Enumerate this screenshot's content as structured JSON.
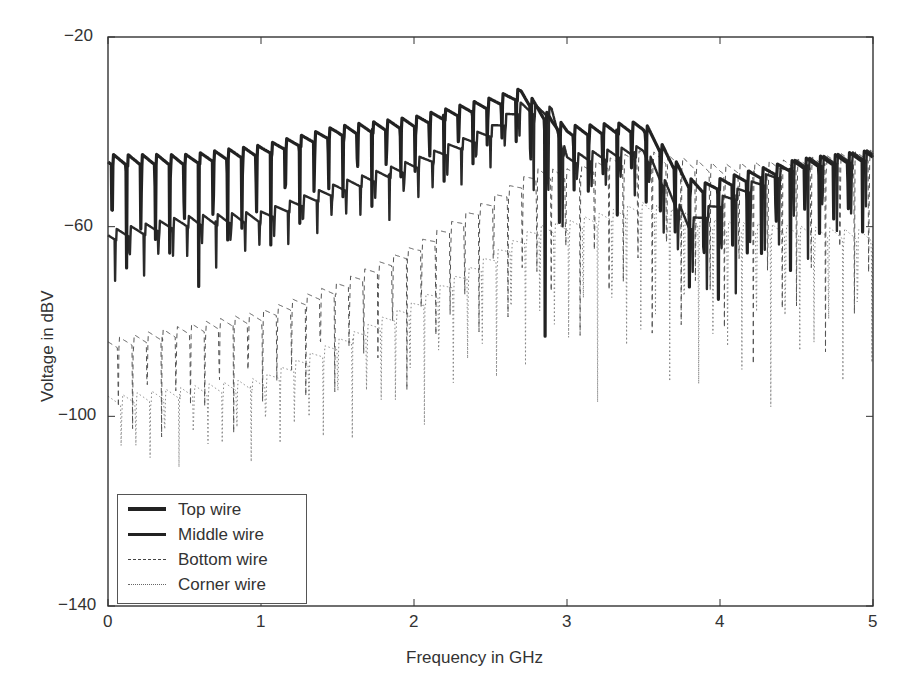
{
  "chart_data": {
    "type": "line",
    "title": "",
    "xlabel": "Frequency in GHz",
    "ylabel": "Voltage in dBV",
    "xlim": [
      0,
      5
    ],
    "ylim": [
      -140,
      -20
    ],
    "xticks": [
      "0",
      "1",
      "2",
      "3",
      "4",
      "5"
    ],
    "yticks": [
      "-20",
      "-60",
      "-100",
      "-140"
    ],
    "grid": false,
    "legend_position": "lower left",
    "series": [
      {
        "name": "Top wire",
        "style": "solid-thick",
        "x": [
          0,
          0.5,
          1.0,
          1.5,
          2.0,
          2.5,
          2.7,
          2.9,
          3.0,
          3.5,
          3.8,
          3.9,
          4.0,
          4.5,
          5.0
        ],
        "envelope": [
          -46,
          -46,
          -44,
          -40,
          -38,
          -34,
          -32,
          -38,
          -40,
          -39,
          -51,
          -52,
          -51,
          -47,
          -45
        ],
        "dips_min": [
          -75,
          -75,
          -70,
          -60,
          -55,
          -50,
          -45,
          -104,
          -60,
          -60,
          -80,
          -88,
          -80,
          -70,
          -65
        ]
      },
      {
        "name": "Middle wire",
        "style": "solid",
        "x": [
          0,
          0.5,
          1.0,
          1.5,
          2.0,
          2.5,
          2.7,
          2.9,
          3.0,
          3.5,
          3.8,
          4.0,
          4.5,
          5.0
        ],
        "envelope": [
          -62,
          -59,
          -58,
          -52,
          -47,
          -40,
          -35,
          -36,
          -46,
          -44,
          -60,
          -55,
          -47,
          -45
        ],
        "dips_min": [
          -75,
          -70,
          -68,
          -62,
          -58,
          -50,
          -45,
          -80,
          -55,
          -55,
          -78,
          -80,
          -70,
          -65
        ]
      },
      {
        "name": "Bottom wire",
        "style": "dashed",
        "x": [
          0,
          0.5,
          1.0,
          1.5,
          2.0,
          2.5,
          2.8,
          3.0,
          3.5,
          4.0,
          4.5,
          5.0
        ],
        "envelope": [
          -85,
          -82,
          -79,
          -73,
          -65,
          -55,
          -49,
          -49,
          -45,
          -48,
          -47,
          -45
        ],
        "dips_min": [
          -110,
          -108,
          -105,
          -100,
          -95,
          -88,
          -85,
          -85,
          -90,
          -95,
          -95,
          -90
        ]
      },
      {
        "name": "Corner wire",
        "style": "dotted",
        "x": [
          0,
          0.5,
          1.0,
          1.5,
          2.0,
          2.5,
          2.8,
          3.0,
          3.5,
          4.0,
          4.5,
          5.0
        ],
        "envelope": [
          -97,
          -95,
          -93,
          -85,
          -77,
          -67,
          -61,
          -60,
          -56,
          -60,
          -61,
          -62
        ],
        "dips_min": [
          -115,
          -113,
          -112,
          -110,
          -105,
          -100,
          -95,
          -95,
          -100,
          -105,
          -100,
          -98
        ]
      }
    ]
  },
  "axes": {
    "xlabel": "Frequency in GHz",
    "ylabel": "Voltage in dBV"
  },
  "legend": [
    "Top wire",
    "Middle wire",
    "Bottom wire",
    "Corner wire"
  ]
}
